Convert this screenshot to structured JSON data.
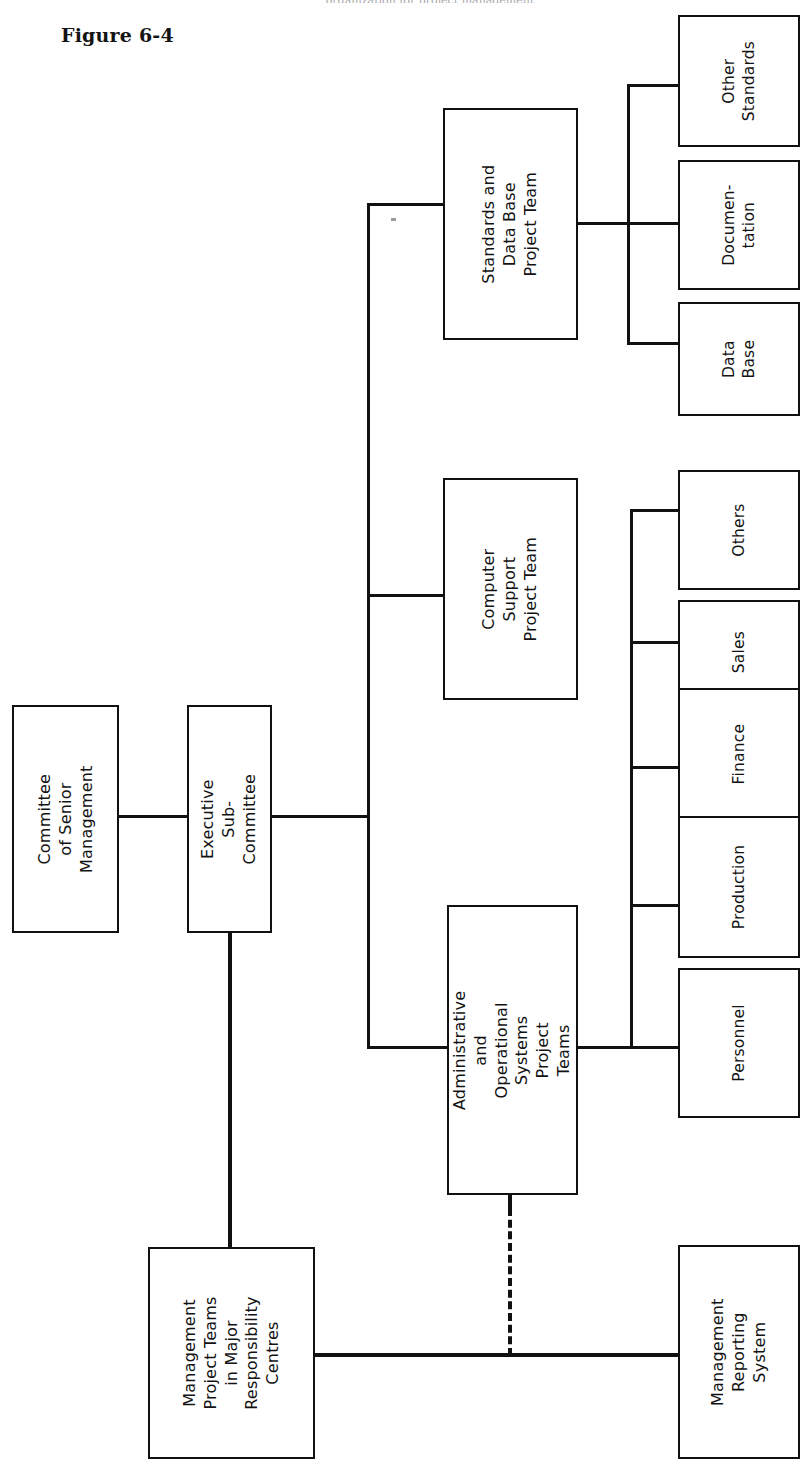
{
  "figure": {
    "title": "Figure 6-4",
    "top_cropped_caption": "organization for project management"
  },
  "diagram": {
    "type": "organizational-chart",
    "orientation": "rotated-90-ccw",
    "line_color": "#111111",
    "box_fill": "#ffffff",
    "nodes": [
      {
        "id": "committee-of-senior-management",
        "label": "Committee\nof Senior\nManagement",
        "x": 12,
        "y": 705,
        "w": 107,
        "h": 228
      },
      {
        "id": "executive-sub-committee",
        "label": "Executive\nSub-Committee",
        "x": 187,
        "y": 705,
        "w": 85,
        "h": 228
      },
      {
        "id": "standards-and-data-base-project-team",
        "label": "Standards and\nData Base\nProject Team",
        "x": 443,
        "y": 108,
        "w": 135,
        "h": 232
      },
      {
        "id": "computer-support-project-team",
        "label": "Computer Support\nProject Team",
        "x": 443,
        "y": 478,
        "w": 135,
        "h": 222
      },
      {
        "id": "administrative-and-operational-systems-project-teams",
        "label": "Administrative\nand Operational\nSystems Project\nTeams",
        "x": 447,
        "y": 905,
        "w": 131,
        "h": 290
      },
      {
        "id": "other-standards",
        "label": "Other\nStandards",
        "x": 678,
        "y": 15,
        "w": 122,
        "h": 132
      },
      {
        "id": "documentation",
        "label": "Documen-\ntation",
        "x": 678,
        "y": 160,
        "w": 122,
        "h": 130
      },
      {
        "id": "data-base",
        "label": "Data\nBase",
        "x": 678,
        "y": 302,
        "w": 122,
        "h": 114
      },
      {
        "id": "others",
        "label": "Others",
        "x": 678,
        "y": 470,
        "w": 122,
        "h": 120
      },
      {
        "id": "sales",
        "label": "Sales",
        "x": 678,
        "y": 600,
        "w": 122,
        "h": 104
      },
      {
        "id": "finance",
        "label": "Finance",
        "x": 678,
        "y": 688,
        "w": 122,
        "h": 132
      },
      {
        "id": "production",
        "label": "Production",
        "x": 678,
        "y": 816,
        "w": 122,
        "h": 142
      },
      {
        "id": "personnel",
        "label": "Personnel",
        "x": 678,
        "y": 968,
        "w": 122,
        "h": 150
      },
      {
        "id": "management-project-teams-in-major-responsibility-centres",
        "label": "Management\nProject Teams\nin Major\nResponsibility\nCentres",
        "x": 148,
        "y": 1247,
        "w": 167,
        "h": 212
      },
      {
        "id": "management-reporting-system",
        "label": "Management\nReporting\nSystem",
        "x": 678,
        "y": 1245,
        "w": 122,
        "h": 214
      }
    ],
    "edges": [
      {
        "from": "committee-of-senior-management",
        "to": "executive-sub-committee",
        "style": "solid"
      },
      {
        "from": "executive-sub-committee",
        "to": "main-trunk",
        "style": "solid"
      },
      {
        "from": "main-trunk",
        "to": "standards-and-data-base-project-team",
        "style": "solid"
      },
      {
        "from": "main-trunk",
        "to": "computer-support-project-team",
        "style": "solid"
      },
      {
        "from": "main-trunk",
        "to": "administrative-and-operational-systems-project-teams",
        "style": "solid"
      },
      {
        "from": "standards-and-data-base-project-team",
        "to": "other-standards",
        "style": "solid"
      },
      {
        "from": "standards-and-data-base-project-team",
        "to": "documentation",
        "style": "solid"
      },
      {
        "from": "standards-and-data-base-project-team",
        "to": "data-base",
        "style": "solid"
      },
      {
        "from": "administrative-and-operational-systems-project-teams",
        "to": "others",
        "style": "solid"
      },
      {
        "from": "administrative-and-operational-systems-project-teams",
        "to": "sales",
        "style": "solid"
      },
      {
        "from": "administrative-and-operational-systems-project-teams",
        "to": "finance",
        "style": "solid"
      },
      {
        "from": "administrative-and-operational-systems-project-teams",
        "to": "production",
        "style": "solid"
      },
      {
        "from": "administrative-and-operational-systems-project-teams",
        "to": "personnel",
        "style": "solid"
      },
      {
        "from": "executive-sub-committee",
        "to": "management-project-teams-in-major-responsibility-centres",
        "style": "solid"
      },
      {
        "from": "management-project-teams-in-major-responsibility-centres",
        "to": "management-reporting-system",
        "style": "solid"
      },
      {
        "from": "administrative-and-operational-systems-project-teams",
        "to": "management-reporting-system",
        "style": "dashed"
      }
    ]
  }
}
